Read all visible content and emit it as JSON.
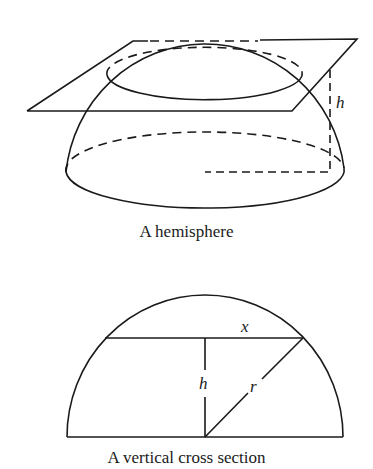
{
  "figures": [
    {
      "caption": "A hemisphere",
      "labels": {
        "height": "h"
      }
    },
    {
      "caption": "A vertical cross section",
      "labels": {
        "half_chord": "x",
        "height": "h",
        "radius": "r"
      }
    }
  ],
  "colors": {
    "ink": "#1a1a1a",
    "background": "#ffffff"
  }
}
